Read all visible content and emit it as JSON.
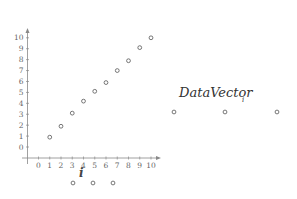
{
  "chart_data": {
    "type": "scatter",
    "title": "",
    "xlabel": "i",
    "ylabel": "",
    "xlim": [
      0,
      10
    ],
    "ylim": [
      0,
      10
    ],
    "x_ticks": [
      "0",
      "1",
      "2",
      "3",
      "4",
      "5",
      "6",
      "7",
      "8",
      "9",
      "10"
    ],
    "y_ticks": [
      "0",
      "1",
      "2",
      "3",
      "4",
      "5",
      "6",
      "7",
      "8",
      "9",
      "10"
    ],
    "grid": false,
    "legend": null,
    "series": [
      {
        "name": "DataVector_i",
        "x": [
          1,
          2,
          3,
          4,
          5,
          6,
          7,
          8,
          9,
          10
        ],
        "values": [
          0.9,
          1.9,
          3.1,
          4.2,
          5.1,
          5.9,
          7.0,
          7.9,
          9.1,
          10.0
        ]
      }
    ],
    "annotations": [
      {
        "text": "DataVector",
        "subscript": "i"
      }
    ],
    "stray_markers_below_axis": 3,
    "stray_markers_right": 3
  },
  "labels": {
    "x_axis_title": "i",
    "vector_name": "DataVector",
    "vector_subscript": "i"
  },
  "style": {
    "axis_color": "#888888",
    "marker_stroke": "#555555",
    "text_color": "#666666"
  }
}
